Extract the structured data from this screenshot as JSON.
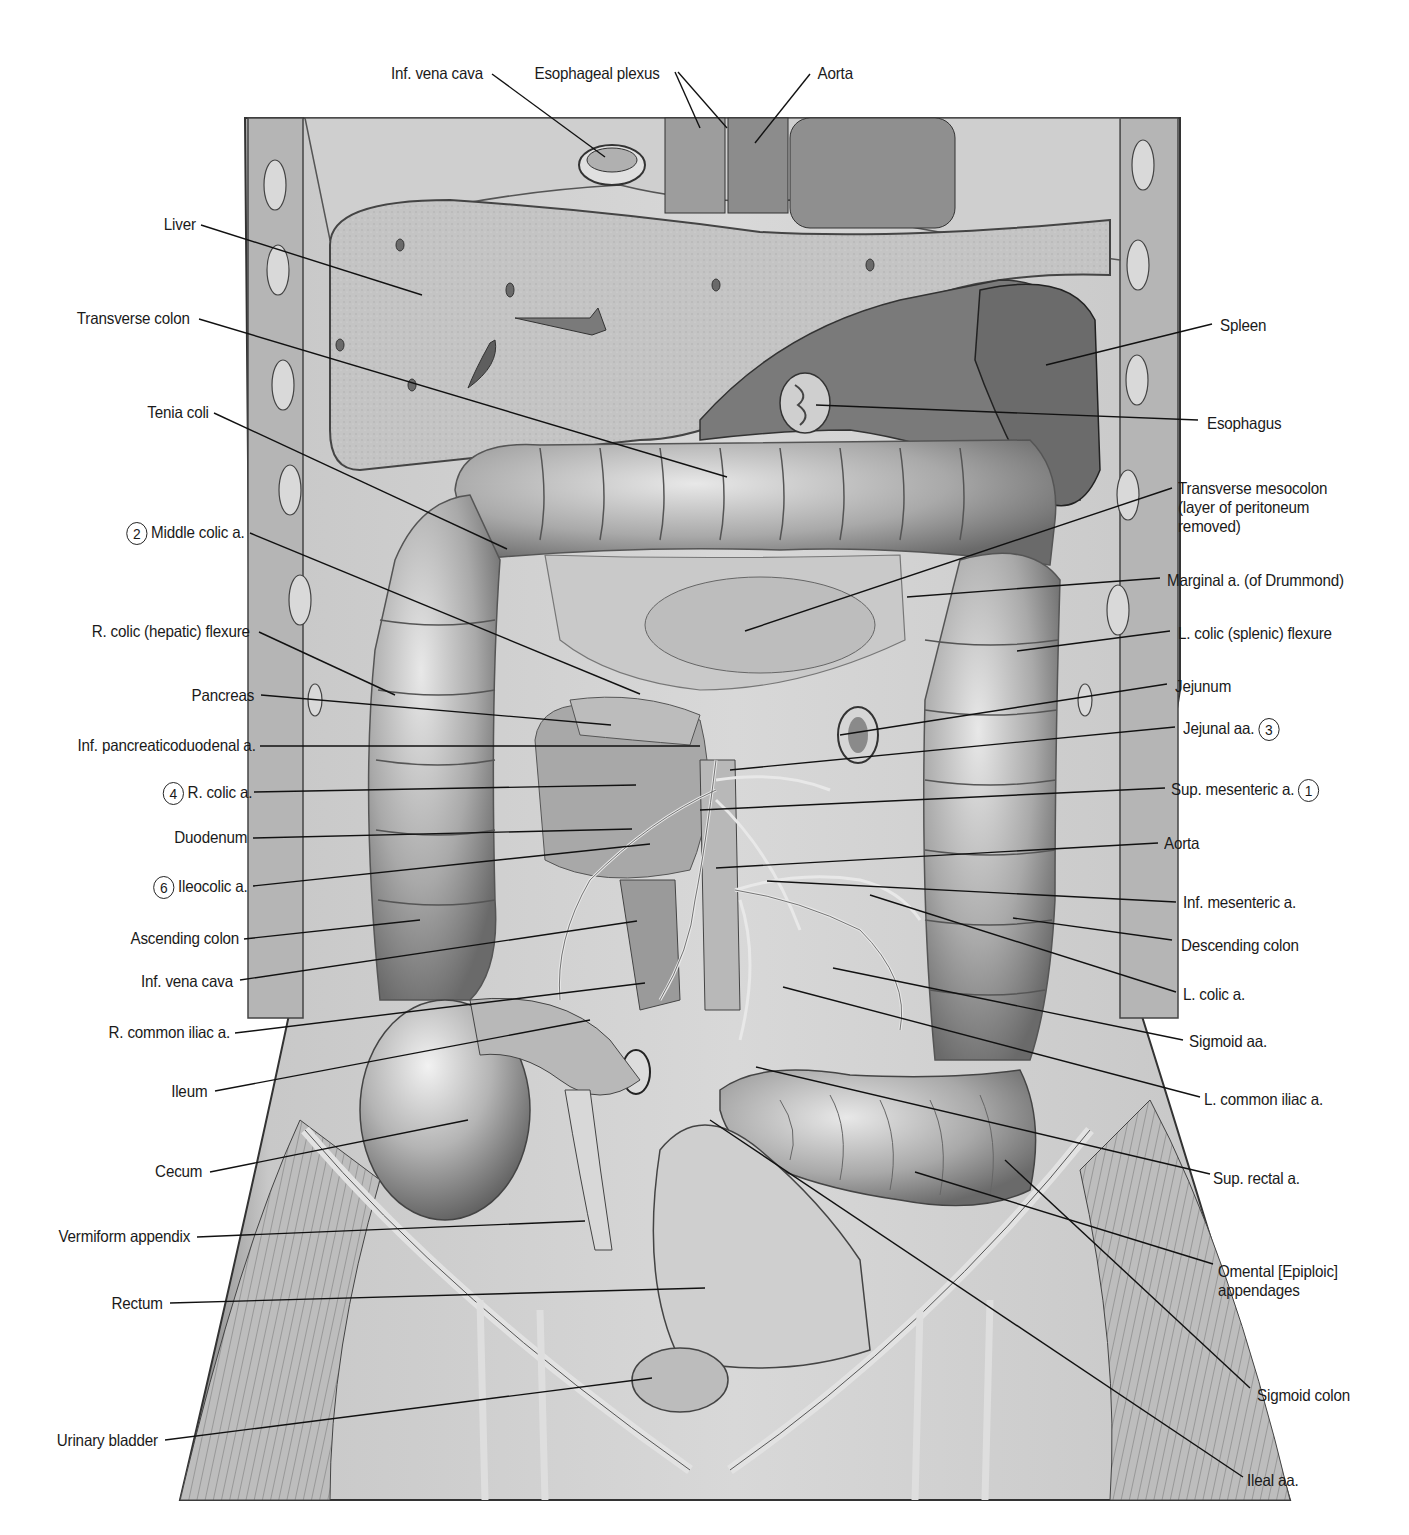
{
  "figure": {
    "domain": "anatomical illustration",
    "colors": {
      "background": "#ffffff",
      "ink": "#1a1a1a",
      "tissue_light": "#d2d2d2",
      "tissue_mid": "#a8a8a8",
      "tissue_dark": "#5e5e5e"
    }
  },
  "labels": {
    "top": [
      {
        "id": "inf-vena-cava-top",
        "text": "Inf. vena cava",
        "x": 387,
        "y": 64,
        "lines": [
          [
            492,
            74,
            605,
            157
          ]
        ]
      },
      {
        "id": "esophageal-plexus",
        "text": "Esophageal plexus",
        "x": 529,
        "y": 64,
        "lines": [
          [
            675,
            72,
            700,
            128
          ],
          [
            678,
            72,
            727,
            128
          ]
        ]
      },
      {
        "id": "aorta-top",
        "text": "Aorta",
        "x": 816,
        "y": 64,
        "lines": [
          [
            810,
            74,
            755,
            143
          ]
        ]
      }
    ],
    "left": [
      {
        "id": "liver",
        "text": "Liver",
        "right": 196,
        "y": 215,
        "lines": [
          [
            201,
            225,
            422,
            295
          ]
        ]
      },
      {
        "id": "transverse-colon",
        "text": "Transverse colon",
        "right": 190,
        "y": 309,
        "lines": [
          [
            199,
            319,
            727,
            477
          ]
        ]
      },
      {
        "id": "tenia-coli",
        "text": "Tenia coli",
        "right": 209,
        "y": 403,
        "lines": [
          [
            214,
            413,
            507,
            549
          ]
        ]
      },
      {
        "id": "middle-colic-a",
        "text": "Middle colic a.",
        "num": "2",
        "right": 245,
        "y": 522,
        "lines": [
          [
            250,
            533,
            640,
            694
          ]
        ]
      },
      {
        "id": "r-colic-flexure",
        "text": "R. colic (hepatic) flexure",
        "right": 250,
        "y": 622,
        "lines": [
          [
            259,
            632,
            395,
            695
          ]
        ]
      },
      {
        "id": "pancreas",
        "text": "Pancreas",
        "right": 254,
        "y": 686,
        "lines": [
          [
            261,
            695,
            611,
            725
          ]
        ]
      },
      {
        "id": "inf-pancreaticoduodenal-a",
        "text": "Inf. pancreaticoduodenal a.",
        "right": 256,
        "y": 736,
        "lines": [
          [
            260,
            746,
            700,
            746
          ]
        ]
      },
      {
        "id": "r-colic-a",
        "text": "R. colic a.",
        "num": "4",
        "right": 252,
        "y": 782,
        "lines": [
          [
            254,
            792,
            636,
            785
          ]
        ]
      },
      {
        "id": "duodenum",
        "text": "Duodenum",
        "right": 247,
        "y": 828,
        "lines": [
          [
            253,
            838,
            632,
            829
          ]
        ]
      },
      {
        "id": "ileocolic-a",
        "text": "Ileocolic a.",
        "num": "6",
        "right": 248,
        "y": 876,
        "lines": [
          [
            253,
            886,
            650,
            844
          ]
        ]
      },
      {
        "id": "ascending-colon",
        "text": "Ascending colon",
        "right": 239,
        "y": 929,
        "lines": [
          [
            244,
            939,
            420,
            920
          ]
        ]
      },
      {
        "id": "inf-vena-cava",
        "text": "Inf. vena cava",
        "right": 233,
        "y": 972,
        "lines": [
          [
            240,
            980,
            637,
            921
          ]
        ]
      },
      {
        "id": "r-common-iliac-a",
        "text": "R. common iliac a.",
        "right": 230,
        "y": 1023,
        "lines": [
          [
            235,
            1033,
            645,
            983
          ]
        ]
      },
      {
        "id": "ileum",
        "text": "Ileum",
        "right": 207,
        "y": 1082,
        "lines": [
          [
            215,
            1091,
            590,
            1020
          ]
        ]
      },
      {
        "id": "cecum",
        "text": "Cecum",
        "right": 202,
        "y": 1162,
        "lines": [
          [
            210,
            1172,
            468,
            1120
          ]
        ]
      },
      {
        "id": "vermiform-appendix",
        "text": "Vermiform appendix",
        "right": 190,
        "y": 1227,
        "lines": [
          [
            197,
            1237,
            585,
            1221
          ]
        ]
      },
      {
        "id": "rectum",
        "text": "Rectum",
        "right": 163,
        "y": 1294,
        "lines": [
          [
            170,
            1303,
            705,
            1288
          ]
        ]
      },
      {
        "id": "urinary-bladder",
        "text": "Urinary bladder",
        "right": 158,
        "y": 1431,
        "lines": [
          [
            165,
            1440,
            652,
            1378
          ]
        ]
      }
    ],
    "right": [
      {
        "id": "spleen",
        "text": "Spleen",
        "left": 1220,
        "y": 316,
        "lines": [
          [
            1212,
            324,
            1046,
            365
          ]
        ]
      },
      {
        "id": "esophagus",
        "text": "Esophagus",
        "left": 1207,
        "y": 414,
        "lines": [
          [
            1198,
            420,
            816,
            405
          ]
        ]
      },
      {
        "id": "transverse-mesocolon",
        "text": "Transverse mesocolon",
        "text2": "(layer of peritoneum",
        "text3": "removed)",
        "left": 1178,
        "y": 479,
        "lines": [
          [
            1172,
            488,
            745,
            631
          ]
        ]
      },
      {
        "id": "marginal-a",
        "text": "Marginal a. (of Drummond)",
        "left": 1167,
        "y": 571,
        "lines": [
          [
            1160,
            578,
            907,
            597
          ]
        ]
      },
      {
        "id": "l-colic-flexure",
        "text": "L. colic (splenic) flexure",
        "left": 1178,
        "y": 624,
        "lines": [
          [
            1170,
            631,
            1017,
            651
          ]
        ]
      },
      {
        "id": "jejunum",
        "text": "Jejunum",
        "left": 1175,
        "y": 677,
        "lines": [
          [
            1167,
            684,
            840,
            735
          ]
        ]
      },
      {
        "id": "jejunal-aa",
        "text": "Jejunal aa.",
        "num": "3",
        "left": 1183,
        "y": 718,
        "lines": [
          [
            1175,
            727,
            730,
            770
          ]
        ]
      },
      {
        "id": "sup-mesenteric-a",
        "text": "Sup. mesenteric a.",
        "num": "1",
        "left": 1171,
        "y": 779,
        "lines": [
          [
            1165,
            788,
            700,
            810
          ]
        ]
      },
      {
        "id": "aorta",
        "text": "Aorta",
        "left": 1164,
        "y": 834,
        "lines": [
          [
            1158,
            843,
            716,
            868
          ]
        ]
      },
      {
        "id": "inf-mesenteric-a",
        "text": "Inf. mesenteric a.",
        "left": 1183,
        "y": 893,
        "lines": [
          [
            1176,
            902,
            767,
            881
          ]
        ]
      },
      {
        "id": "descending-colon",
        "text": "Descending colon",
        "left": 1181,
        "y": 936,
        "lines": [
          [
            1172,
            940,
            1013,
            918
          ]
        ]
      },
      {
        "id": "l-colic-a",
        "text": "L. colic a.",
        "left": 1183,
        "y": 985,
        "lines": [
          [
            1176,
            992,
            870,
            895
          ]
        ]
      },
      {
        "id": "sigmoid-aa",
        "text": "Sigmoid aa.",
        "left": 1189,
        "y": 1032,
        "lines": [
          [
            1183,
            1040,
            833,
            968
          ]
        ]
      },
      {
        "id": "l-common-iliac-a",
        "text": "L. common iliac a.",
        "left": 1204,
        "y": 1090,
        "lines": [
          [
            1200,
            1097,
            783,
            987
          ]
        ]
      },
      {
        "id": "sup-rectal-a",
        "text": "Sup. rectal a.",
        "left": 1213,
        "y": 1169,
        "lines": [
          [
            1210,
            1174,
            756,
            1067
          ]
        ]
      },
      {
        "id": "omental-appendages",
        "text": "Omental [Epiploic]",
        "text2": "appendages",
        "left": 1218,
        "y": 1262,
        "lines": [
          [
            1213,
            1264,
            915,
            1172
          ]
        ]
      },
      {
        "id": "sigmoid-colon",
        "text": "Sigmoid colon",
        "left": 1257,
        "y": 1386,
        "lines": [
          [
            1250,
            1388,
            1005,
            1160
          ]
        ]
      },
      {
        "id": "ileal-aa",
        "text": "Ileal aa.",
        "left": 1247,
        "y": 1471,
        "lines": [
          [
            1243,
            1477,
            710,
            1120
          ]
        ]
      }
    ]
  }
}
